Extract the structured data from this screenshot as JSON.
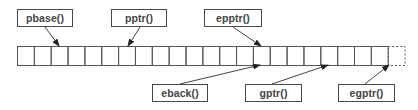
{
  "diagram": {
    "type": "buffer-pointer-diagram",
    "cells": {
      "solid_count": 22,
      "dashed_count": 1,
      "left": 17,
      "top": 46,
      "cell_width": 16.85,
      "cell_height": 19,
      "stroke_color": "#555555"
    },
    "top_labels": [
      {
        "id": "pbase",
        "text": "pbase()",
        "x": 17,
        "y": 9,
        "w": 56,
        "arrow_from": [
          45,
          27
        ],
        "arrow_to": [
          59,
          46
        ]
      },
      {
        "id": "pptr",
        "text": "pptr()",
        "x": 111,
        "y": 9,
        "w": 56,
        "arrow_from": [
          140,
          27
        ],
        "arrow_to": [
          128,
          46
        ]
      },
      {
        "id": "epptr",
        "text": "epptr()",
        "x": 204,
        "y": 9,
        "w": 58,
        "arrow_from": [
          233,
          27
        ],
        "arrow_to": [
          261,
          46
        ]
      }
    ],
    "bottom_labels": [
      {
        "id": "eback",
        "text": "eback()",
        "x": 152,
        "y": 84,
        "w": 56,
        "arrow_from": [
          180,
          84
        ],
        "arrow_to": [
          260,
          65
        ]
      },
      {
        "id": "gptr",
        "text": "gptr()",
        "x": 245,
        "y": 84,
        "w": 57,
        "arrow_from": [
          272,
          84
        ],
        "arrow_to": [
          328,
          65
        ]
      },
      {
        "id": "egptr",
        "text": "egptr()",
        "x": 338,
        "y": 84,
        "w": 57,
        "arrow_from": [
          365,
          84
        ],
        "arrow_to": [
          389,
          65
        ]
      }
    ],
    "colors": {
      "line": "#444444",
      "text": "#444444",
      "background": "#ffffff"
    }
  }
}
